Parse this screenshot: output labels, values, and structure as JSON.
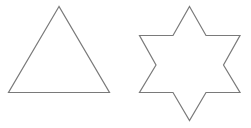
{
  "canvas": {
    "width": 251,
    "height": 128,
    "background": "#ffffff"
  },
  "style": {
    "stroke": "#7a7a7a",
    "stroke_width": 1.2,
    "fill": "none"
  },
  "shapes": [
    {
      "name": "triangle",
      "points": "59,6.5 8.5,92.5 109.5,92.5"
    },
    {
      "name": "six-pointed-star",
      "points": "189.5,6.5 206,35.5 240,35.5 223.5,65 240,92.5 206,92.5 189.5,120.5 173,92.5 139.5,92.5 156,65 139.5,35.5 173,35.5"
    }
  ]
}
